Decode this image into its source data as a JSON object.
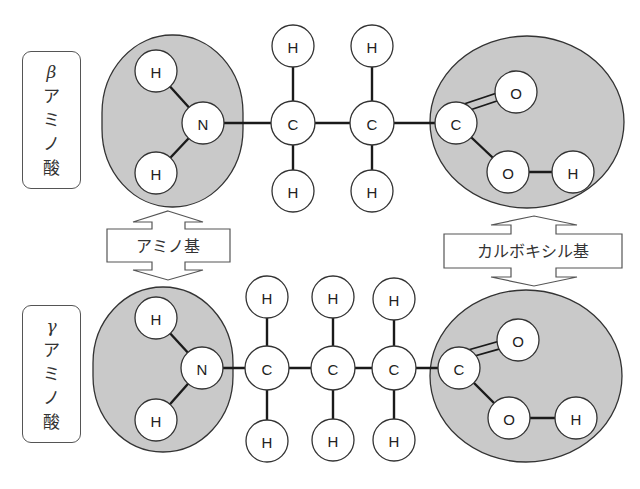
{
  "labels": {
    "beta": {
      "greek": "β",
      "chars": [
        "ア",
        "ミ",
        "ノ",
        "酸"
      ],
      "full": "βアミノ酸"
    },
    "gamma": {
      "greek": "γ",
      "chars": [
        "ア",
        "ミ",
        "ノ",
        "酸"
      ],
      "full": "γアミノ酸"
    }
  },
  "arrows": {
    "amino": "アミノ基",
    "carboxyl": "カルボキシル基"
  },
  "colors": {
    "group_fill": "#c9c9c9",
    "atom_fill": "#ffffff",
    "stroke": "#333333"
  },
  "molecules": {
    "beta": {
      "atoms": [
        {
          "id": "aH1",
          "el": "H",
          "x": 156,
          "y": 71
        },
        {
          "id": "N",
          "el": "N",
          "x": 203,
          "y": 123
        },
        {
          "id": "aH2",
          "el": "H",
          "x": 156,
          "y": 173
        },
        {
          "id": "C1",
          "el": "C",
          "x": 293,
          "y": 123
        },
        {
          "id": "C1a",
          "el": "H",
          "x": 293,
          "y": 46
        },
        {
          "id": "C1b",
          "el": "H",
          "x": 293,
          "y": 191
        },
        {
          "id": "C2",
          "el": "C",
          "x": 372,
          "y": 123
        },
        {
          "id": "C2a",
          "el": "H",
          "x": 372,
          "y": 46
        },
        {
          "id": "C2b",
          "el": "H",
          "x": 372,
          "y": 191
        },
        {
          "id": "Cc",
          "el": "C",
          "x": 456,
          "y": 123
        },
        {
          "id": "O1",
          "el": "O",
          "x": 516,
          "y": 92
        },
        {
          "id": "O2",
          "el": "O",
          "x": 508,
          "y": 172
        },
        {
          "id": "OH",
          "el": "H",
          "x": 573,
          "y": 172
        }
      ]
    },
    "gamma": {
      "atoms": [
        {
          "id": "aH1",
          "el": "H",
          "x": 156,
          "y": 318
        },
        {
          "id": "N",
          "el": "N",
          "x": 202,
          "y": 368
        },
        {
          "id": "aH2",
          "el": "H",
          "x": 156,
          "y": 420
        },
        {
          "id": "C1",
          "el": "C",
          "x": 267,
          "y": 368
        },
        {
          "id": "C1a",
          "el": "H",
          "x": 267,
          "y": 297
        },
        {
          "id": "C1b",
          "el": "H",
          "x": 267,
          "y": 441
        },
        {
          "id": "C2",
          "el": "C",
          "x": 333,
          "y": 368
        },
        {
          "id": "C2a",
          "el": "H",
          "x": 333,
          "y": 297
        },
        {
          "id": "C2b",
          "el": "H",
          "x": 333,
          "y": 440
        },
        {
          "id": "C3",
          "el": "C",
          "x": 394,
          "y": 368
        },
        {
          "id": "C3a",
          "el": "H",
          "x": 394,
          "y": 299
        },
        {
          "id": "C3b",
          "el": "H",
          "x": 394,
          "y": 440
        },
        {
          "id": "Cc",
          "el": "C",
          "x": 459,
          "y": 368
        },
        {
          "id": "O1",
          "el": "O",
          "x": 518,
          "y": 340
        },
        {
          "id": "O2",
          "el": "O",
          "x": 509,
          "y": 418
        },
        {
          "id": "OH",
          "el": "H",
          "x": 576,
          "y": 418
        }
      ]
    }
  }
}
